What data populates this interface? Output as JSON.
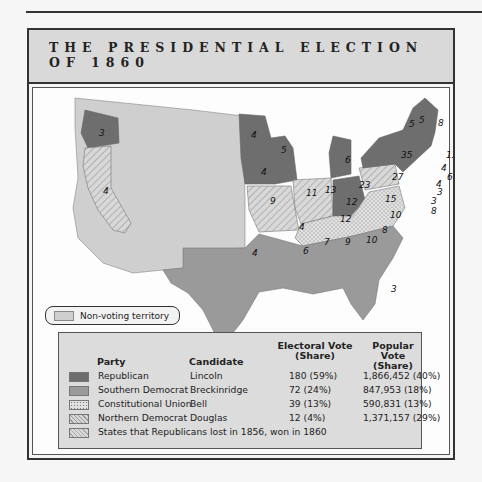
{
  "title": {
    "line1": "THE PRESIDENTIAL ELECTION",
    "line2": "OF 1860"
  },
  "colors": {
    "republican": "#6e6e6e",
    "southern_democrat": "#9a9a9a",
    "constitutional_union": "#d4d4d4",
    "northern_democrat": "#cccccc",
    "non_voting": "#cfcfcf",
    "frame": "#333333",
    "legend_bg": "#dcdcdc"
  },
  "non_voting_label": "Non-voting territory",
  "legend": {
    "headers": {
      "party": "Party",
      "candidate": "Candidate",
      "electoral": "Electoral Vote",
      "electoral_sub": "(Share)",
      "popular": "Popular Vote",
      "popular_sub": "(Share)"
    },
    "rows": [
      {
        "party": "Republican",
        "candidate": "Lincoln",
        "electoral": "180 (59%)",
        "popular": "1,866,452 (40%)",
        "swatch": "solid-dark"
      },
      {
        "party": "Southern Democrat",
        "candidate": "Breckinridge",
        "electoral": "72 (24%)",
        "popular": "847,953 (18%)",
        "swatch": "solid-medium"
      },
      {
        "party": "Constitutional Union",
        "candidate": "Bell",
        "electoral": "39 (13%)",
        "popular": "590,831 (13%)",
        "swatch": "dotted"
      },
      {
        "party": "Northern Democrat",
        "candidate": "Douglas",
        "electoral": "12 (4%)",
        "popular": "1,371,157 (29%)",
        "swatch": "hatched"
      },
      {
        "note": "States that Republicans lost in 1856, won in 1860",
        "swatch": "hatched-light"
      }
    ]
  },
  "map_labels": [
    {
      "state": "Oregon",
      "ev": "3"
    },
    {
      "state": "California",
      "ev": "4"
    },
    {
      "state": "Minnesota",
      "ev": "4"
    },
    {
      "state": "Wisconsin",
      "ev": "5"
    },
    {
      "state": "Iowa",
      "ev": "4"
    },
    {
      "state": "Michigan",
      "ev": "6"
    },
    {
      "state": "Illinois",
      "ev": "11"
    },
    {
      "state": "Indiana",
      "ev": "13"
    },
    {
      "state": "Ohio",
      "ev": "23"
    },
    {
      "state": "Pennsylvania",
      "ev": "27"
    },
    {
      "state": "New York",
      "ev": "35"
    },
    {
      "state": "Vermont",
      "ev": "5"
    },
    {
      "state": "New Hampshire",
      "ev": "5"
    },
    {
      "state": "Maine",
      "ev": "8"
    },
    {
      "state": "Massachusetts",
      "ev": "13"
    },
    {
      "state": "Rhode Island",
      "ev": "4"
    },
    {
      "state": "Connecticut",
      "ev": "6"
    },
    {
      "state": "New Jersey",
      "ev": "4"
    },
    {
      "state": "Delaware",
      "ev": "3"
    },
    {
      "state": "Maryland",
      "ev": "8"
    },
    {
      "state": "Delaware-2",
      "ev": "3"
    },
    {
      "state": "Missouri",
      "ev": "9"
    },
    {
      "state": "Kentucky",
      "ev": "12"
    },
    {
      "state": "Virginia",
      "ev": "15"
    },
    {
      "state": "Tennessee",
      "ev": "12"
    },
    {
      "state": "North Carolina",
      "ev": "10"
    },
    {
      "state": "South Carolina",
      "ev": "8"
    },
    {
      "state": "Georgia",
      "ev": "10"
    },
    {
      "state": "Alabama",
      "ev": "9"
    },
    {
      "state": "Mississippi",
      "ev": "7"
    },
    {
      "state": "Arkansas",
      "ev": "4"
    },
    {
      "state": "Louisiana",
      "ev": "6"
    },
    {
      "state": "Texas",
      "ev": "4"
    },
    {
      "state": "Florida",
      "ev": "3"
    }
  ]
}
